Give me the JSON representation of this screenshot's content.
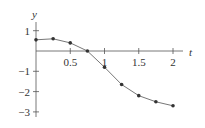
{
  "chart_data": {
    "type": "line",
    "title": "",
    "xlabel": "t",
    "ylabel": "y",
    "xlim": [
      0,
      2.2
    ],
    "ylim": [
      -3.2,
      1.5
    ],
    "xticks": [
      0.5,
      1,
      1.5,
      2
    ],
    "xtick_labels": [
      "0.5",
      "1",
      "1.5",
      "2"
    ],
    "yticks": [
      1,
      -1,
      -2,
      -3
    ],
    "ytick_labels": [
      "1",
      "−1",
      "−2",
      "−3"
    ],
    "grid": false,
    "legend": null,
    "series": [
      {
        "name": "y(t)",
        "x": [
          0,
          0.25,
          0.5,
          0.75,
          1.0,
          1.25,
          1.5,
          1.75,
          2.0
        ],
        "y": [
          0.55,
          0.6,
          0.4,
          0.0,
          -0.8,
          -1.65,
          -2.2,
          -2.5,
          -2.7
        ],
        "markers": true
      }
    ]
  },
  "colors": {
    "axis": "#555555",
    "line": "#777777",
    "marker": "#333333",
    "text": "#333333"
  }
}
